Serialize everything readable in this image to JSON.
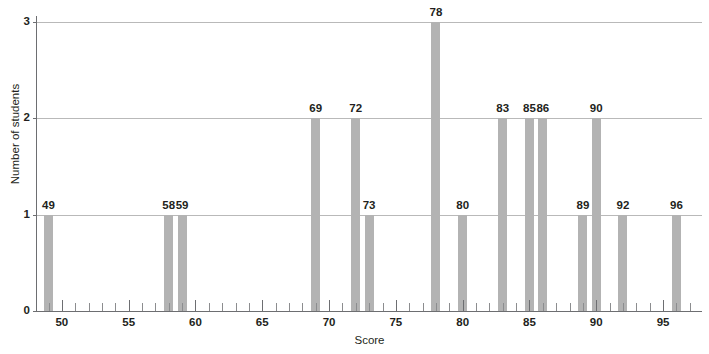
{
  "chart_data": {
    "type": "bar",
    "title": "",
    "xlabel": "Score",
    "ylabel": "Number of students",
    "xlim": [
      48.2,
      97.0
    ],
    "ylim": [
      0,
      3
    ],
    "grid": true,
    "legend": "none",
    "y_ticks": [
      "0",
      "1",
      "2",
      "3"
    ],
    "y_tick_values": [
      0,
      1,
      2,
      3
    ],
    "x_ticks": [
      "50",
      "55",
      "60",
      "65",
      "70",
      "75",
      "80",
      "85",
      "90",
      "95"
    ],
    "x_tick_values": [
      50,
      55,
      60,
      65,
      70,
      75,
      80,
      85,
      90,
      95
    ],
    "x_minor_tick_step": 1,
    "bar_color": "#b3b3b3",
    "gridline_color": "#b9b9b9",
    "axis_color": "#6d6e71",
    "text_color": "#231f20",
    "categories": [
      49,
      58,
      59,
      69,
      72,
      73,
      78,
      80,
      83,
      85,
      86,
      89,
      90,
      92,
      96
    ],
    "values": [
      1,
      1,
      1,
      2,
      2,
      1,
      3,
      1,
      2,
      2,
      2,
      1,
      2,
      1,
      1
    ],
    "bars": [
      {
        "x": 49,
        "y": 1,
        "label": "49"
      },
      {
        "x": 58,
        "y": 1,
        "label": "58"
      },
      {
        "x": 59,
        "y": 1,
        "label": "59"
      },
      {
        "x": 69,
        "y": 2,
        "label": "69"
      },
      {
        "x": 72,
        "y": 2,
        "label": "72"
      },
      {
        "x": 73,
        "y": 1,
        "label": "73"
      },
      {
        "x": 78,
        "y": 3,
        "label": "78"
      },
      {
        "x": 80,
        "y": 1,
        "label": "80"
      },
      {
        "x": 83,
        "y": 2,
        "label": "83"
      },
      {
        "x": 85,
        "y": 2,
        "label": "85"
      },
      {
        "x": 86,
        "y": 2,
        "label": "86"
      },
      {
        "x": 89,
        "y": 1,
        "label": "89"
      },
      {
        "x": 90,
        "y": 2,
        "label": "90"
      },
      {
        "x": 92,
        "y": 1,
        "label": "92"
      },
      {
        "x": 96,
        "y": 1,
        "label": "96"
      }
    ]
  }
}
